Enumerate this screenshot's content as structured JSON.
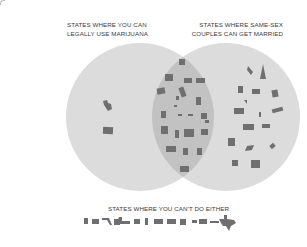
{
  "diagram": {
    "type": "venn",
    "sets": [
      {
        "id": "marijuana",
        "label_lines": [
          "STATES WHERE YOU CAN",
          "LEGALLY USE MARIJUANA"
        ]
      },
      {
        "id": "same_sex_marriage",
        "label_lines": [
          "STATES WHERE SAME-SEX",
          "COUPLES CAN GET MARRIED"
        ]
      }
    ],
    "outside_label": "STATES WHERE YOU CAN'T DO EITHER",
    "counts": {
      "marijuana_only": 2,
      "both": 22,
      "marriage_only": 16,
      "neither": 15
    },
    "colors": {
      "circle": "#d9d9d9",
      "overlap": "#bfbfbf",
      "state_shape": "#6f6f6f",
      "text": "#3a3a3a"
    }
  }
}
